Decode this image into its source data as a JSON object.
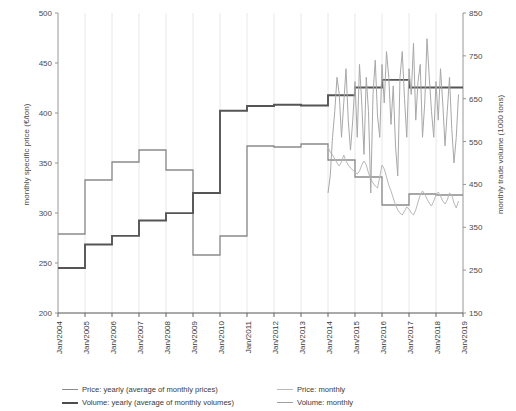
{
  "chart_data": {
    "type": "line",
    "title": "",
    "xlabel": "",
    "ylabel": "monthly specific price (€/ton)",
    "ylabel_right": "monthly trade volume (1000 tons)",
    "grid": "vertical",
    "legend_position": "bottom",
    "x_axis": {
      "ticks": [
        "Jan/2004",
        "Jan/2005",
        "Jan/2006",
        "Jan/2007",
        "Jan/2008",
        "Jan/2009",
        "Jan/2010",
        "Jan/2011",
        "Jan/2012",
        "Jan/2013",
        "Jan/2014",
        "Jan/2015",
        "Jan/2016",
        "Jan/2017",
        "Jan/2018",
        "Jan/2019"
      ],
      "min": 2004.0,
      "max": 2019.0
    },
    "y_axis_left": {
      "ticks": [
        200,
        250,
        300,
        350,
        400,
        450,
        500
      ],
      "min": 200,
      "max": 500,
      "unit": "€/ton"
    },
    "y_axis_right": {
      "ticks": [
        150,
        250,
        350,
        450,
        550,
        650,
        750,
        850
      ],
      "min": 150,
      "max": 850,
      "unit": "1000 tons"
    },
    "series": [
      {
        "name": "Price: yearly (average of monthly prices)",
        "key": "price_yearly",
        "axis": "left",
        "style": "step",
        "color": "#8a8a8a",
        "years": [
          2004,
          2005,
          2006,
          2007,
          2008,
          2009,
          2010,
          2011,
          2012,
          2013,
          2014,
          2015,
          2016,
          2017,
          2018
        ],
        "values": [
          279,
          333,
          351,
          363,
          343,
          258,
          277,
          367,
          366,
          369,
          353,
          336,
          308,
          319,
          318
        ]
      },
      {
        "name": "Volume: yearly (average of monthly volumes)",
        "key": "volume_yearly",
        "axis": "right",
        "style": "step",
        "color": "#555555",
        "years": [
          2004,
          2005,
          2006,
          2007,
          2008,
          2009,
          2010,
          2011,
          2012,
          2013,
          2014,
          2015,
          2016,
          2017,
          2018
        ],
        "values": [
          255,
          310,
          330,
          366,
          383,
          430,
          622,
          633,
          636,
          634,
          658,
          676,
          694,
          676,
          676
        ]
      },
      {
        "name": "Price: monthly",
        "key": "price_monthly",
        "axis": "left",
        "style": "line",
        "color": "#b9b9b9",
        "start": "Jan/2014",
        "end": "Jul/2018",
        "values": [
          366,
          361,
          358,
          354,
          350,
          347,
          351,
          358,
          352,
          348,
          345,
          343,
          341,
          339,
          342,
          348,
          352,
          348,
          340,
          334,
          330,
          327,
          325,
          336,
          348,
          344,
          336,
          328,
          322,
          315,
          308,
          303,
          300,
          298,
          302,
          306,
          304,
          300,
          298,
          303,
          311,
          318,
          322,
          319,
          314,
          310,
          307,
          312,
          318,
          321,
          317,
          312,
          309,
          313,
          320,
          318,
          310,
          305,
          312
        ]
      },
      {
        "name": "Volume: monthly",
        "key": "volume_monthly",
        "axis": "right",
        "style": "line",
        "color": "#a8a8a8",
        "start": "Jan/2014",
        "end": "Jul/2018",
        "values": [
          430,
          470,
          560,
          620,
          700,
          660,
          560,
          640,
          720,
          600,
          530,
          600,
          690,
          560,
          730,
          640,
          520,
          700,
          620,
          430,
          660,
          740,
          610,
          560,
          730,
          640,
          760,
          700,
          590,
          680,
          540,
          470,
          700,
          760,
          650,
          560,
          720,
          660,
          780,
          600,
          690,
          730,
          560,
          640,
          790,
          700,
          620,
          560,
          690,
          600,
          720,
          640,
          540,
          620,
          700,
          580,
          500,
          560,
          660
        ]
      }
    ]
  },
  "legend": {
    "items": [
      {
        "label": "Price: yearly (average of monthly prices)",
        "color": "#8a8a8a",
        "width": 1.6
      },
      {
        "label": "Price: monthly",
        "color": "#b9b9b9",
        "width": 1.3
      },
      {
        "label": "Volume: yearly (average of monthly volumes)",
        "color": "#4d4d4d",
        "width": 2.2
      },
      {
        "label": "Volume: monthly",
        "color": "#a0a0a0",
        "width": 1.3
      }
    ]
  }
}
